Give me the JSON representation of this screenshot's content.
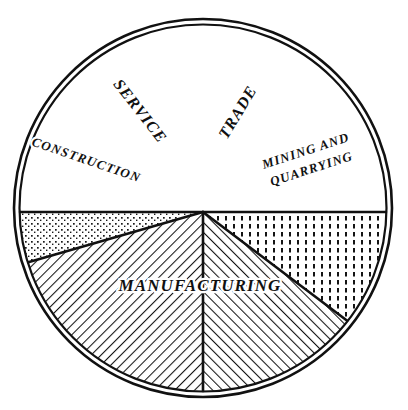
{
  "figure": {
    "top_caption": ". . , . . . , . . . , . . .",
    "background_color": "#ffffff",
    "ink_color": "#111111"
  },
  "chart_data": {
    "type": "pie",
    "title": "",
    "subtitle": "",
    "xlabel": "",
    "ylabel": "",
    "legend_position": "none",
    "grid": false,
    "labels_inside_slices": true,
    "center": {
      "x": 203,
      "y": 212
    },
    "radius": 190,
    "outline_style": "double-ring",
    "categories": [
      "Manufacturing",
      "Service",
      "Trade",
      "Mining and Quarrying",
      "Construction"
    ],
    "values": [
      50,
      20.5,
      15.5,
      9.5,
      4.5
    ],
    "units": "percent of total",
    "slices": [
      {
        "name": "Manufacturing",
        "label": "MANUFACTURING",
        "value": 50,
        "start_angle": 0,
        "end_angle": 180,
        "fill": "plain",
        "label_x": 200,
        "label_y": 287,
        "label_rotation": 0,
        "label_font_size": 17,
        "label_lines": [
          "MANUFACTURING"
        ]
      },
      {
        "name": "Construction",
        "label": "CONSTRUCTION",
        "value": 4.5,
        "start_angle": 180,
        "end_angle": 196,
        "fill": "stipple",
        "label_x": 86,
        "label_y": 161,
        "label_rotation": 19,
        "label_font_size": 13,
        "label_lines": [
          "CONSTRUCTION"
        ]
      },
      {
        "name": "Service",
        "label": "SERVICE",
        "value": 20.5,
        "start_angle": 196,
        "end_angle": 270,
        "fill": "hatch-right",
        "label_x": 139,
        "label_y": 112,
        "label_rotation": 52,
        "label_font_size": 16,
        "label_lines": [
          "SERVICE"
        ]
      },
      {
        "name": "Trade",
        "label": "TRADE",
        "value": 15.5,
        "start_angle": 270,
        "end_angle": 323,
        "fill": "hatch-left",
        "label_x": 239,
        "label_y": 113,
        "label_rotation": -59,
        "label_font_size": 16,
        "label_lines": [
          "TRADE"
        ]
      },
      {
        "name": "Mining and Quarrying",
        "label": "MINING AND QUARRYING",
        "value": 9.5,
        "start_angle": 323,
        "end_angle": 360,
        "fill": "vertical-dash",
        "label_x": 309,
        "label_y": 161,
        "label_rotation": -18,
        "label_font_size": 13,
        "label_lines": [
          "MINING AND",
          "QUARRYING"
        ]
      }
    ]
  }
}
